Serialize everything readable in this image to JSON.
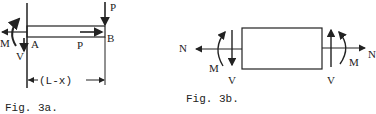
{
  "figures": [
    {
      "id": "fig3a",
      "caption": "Fig. 3a.",
      "labels": {
        "M": "M",
        "V": "V",
        "A": "A",
        "B": "B",
        "P_top": "P",
        "P_axial": "P",
        "span": "(L-x)"
      }
    },
    {
      "id": "fig3b",
      "caption": "Fig. 3b.",
      "labels": {
        "N_left": "N",
        "N_right": "N",
        "M_left": "M",
        "M_right": "M",
        "V_left": "V",
        "V_right": "V"
      }
    }
  ],
  "colors": {
    "ink": "#222222",
    "background": "#ffffff"
  }
}
